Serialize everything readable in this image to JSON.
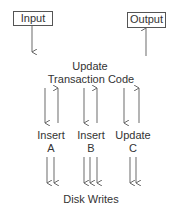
{
  "nodes": {
    "input": "Input",
    "output": "Output",
    "center_line1": "Update",
    "center_line2": "Transaction Code",
    "insert_a_line1": "Insert",
    "insert_a_line2": "A",
    "insert_b_line1": "Insert",
    "insert_b_line2": "B",
    "update_c_line1": "Update",
    "update_c_line2": "C",
    "disk": "Disk Writes"
  },
  "colors": {
    "stroke": "#666666",
    "text": "#333333"
  }
}
